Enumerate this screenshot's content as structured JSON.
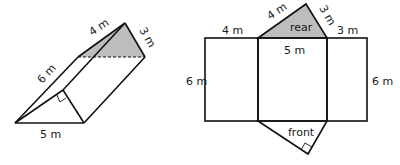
{
  "prism": {
    "labels": {
      "top_edge": "4 m",
      "side_edge": "3 m",
      "length_edge": "6 m",
      "base_edge": "5 m"
    },
    "shaded_face": "rear",
    "right_angle_marker": true,
    "hidden_edge": "dashed"
  },
  "net": {
    "labels": {
      "rear_left_edge": "4 m",
      "rear_right_edge": "3 m",
      "rear_face": "rear",
      "left_rect_top": "4 m",
      "right_rect_top": "3 m",
      "middle_rect_top": "5 m",
      "left_height": "6 m",
      "right_height": "6 m",
      "front_face": "front"
    },
    "shade_color": "#bdbdbd"
  }
}
